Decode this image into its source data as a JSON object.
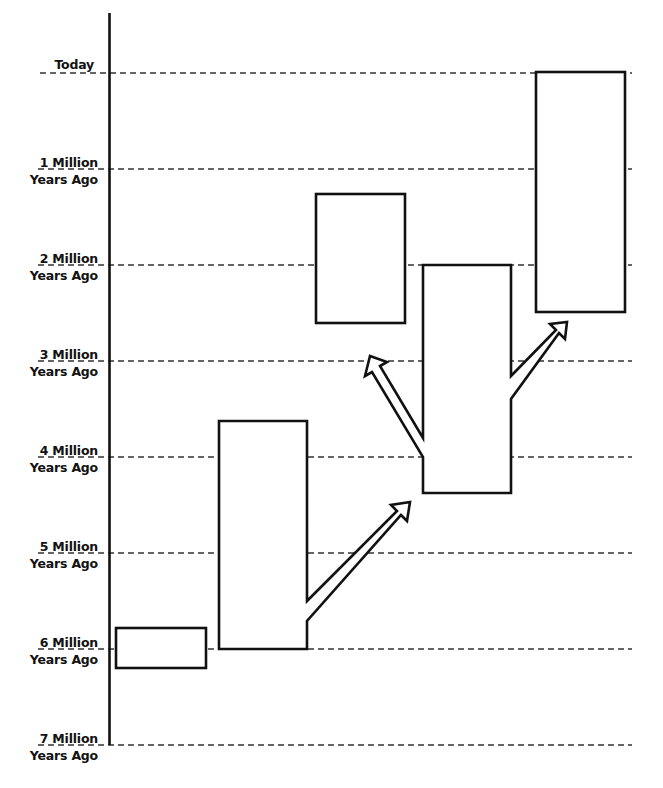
{
  "diagram": {
    "type": "timeline-branching",
    "axis": {
      "orientation": "vertical",
      "units": "millions of years ago",
      "ticks": [
        {
          "value": 0,
          "line1": "Today",
          "line2": ""
        },
        {
          "value": 1,
          "line1": "1 Million",
          "line2": "Years Ago"
        },
        {
          "value": 2,
          "line1": "2 Million",
          "line2": "Years Ago"
        },
        {
          "value": 3,
          "line1": "3 Million",
          "line2": "Years Ago"
        },
        {
          "value": 4,
          "line1": "4 Million",
          "line2": "Years Ago"
        },
        {
          "value": 5,
          "line1": "5 Million",
          "line2": "Years Ago"
        },
        {
          "value": 6,
          "line1": "6 Million",
          "line2": "Years Ago"
        },
        {
          "value": 7,
          "line1": "7 Million",
          "line2": "Years Ago"
        }
      ]
    },
    "boxes": [
      {
        "id": "A",
        "start_mya": 6.4,
        "end_mya": 5.8
      },
      {
        "id": "B",
        "start_mya": 6.0,
        "end_mya": 3.6
      },
      {
        "id": "C",
        "start_mya": 3.4,
        "end_mya": 2.0
      },
      {
        "id": "D",
        "start_mya": 4.4,
        "end_mya": 2.0
      },
      {
        "id": "E",
        "start_mya": 2.5,
        "end_mya": 0.0
      }
    ],
    "arrows": [
      {
        "from": "B",
        "to": "D"
      },
      {
        "from": "D",
        "to": "C"
      },
      {
        "from": "D",
        "to": "E"
      }
    ],
    "colors": {
      "stroke": "#111111",
      "background": "#ffffff",
      "gridline": "#333333"
    }
  }
}
